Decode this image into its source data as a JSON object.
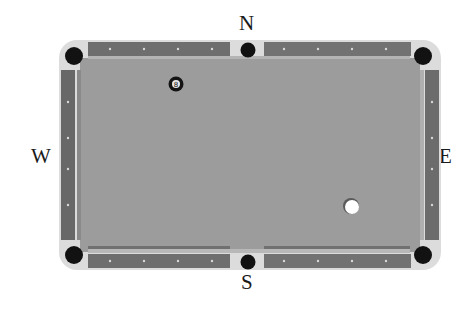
{
  "compass": {
    "north": "N",
    "south": "S",
    "west": "W",
    "east": "E"
  },
  "table": {
    "frame_color": "#d8d8d8",
    "rail_color": "#707070",
    "cloth_color": "#9a9a9a",
    "cushion_color": "#8a8a8a",
    "pocket_color": "#111111",
    "pockets": [
      "top-left",
      "top-middle",
      "top-right",
      "bottom-left",
      "bottom-middle",
      "bottom-right"
    ]
  },
  "balls": [
    {
      "name": "eight-ball",
      "label": "8",
      "cx": 176,
      "cy": 84,
      "color": "#111111"
    },
    {
      "name": "cue-ball",
      "label": "",
      "cx": 351,
      "cy": 206,
      "color": "#ffffff"
    }
  ]
}
